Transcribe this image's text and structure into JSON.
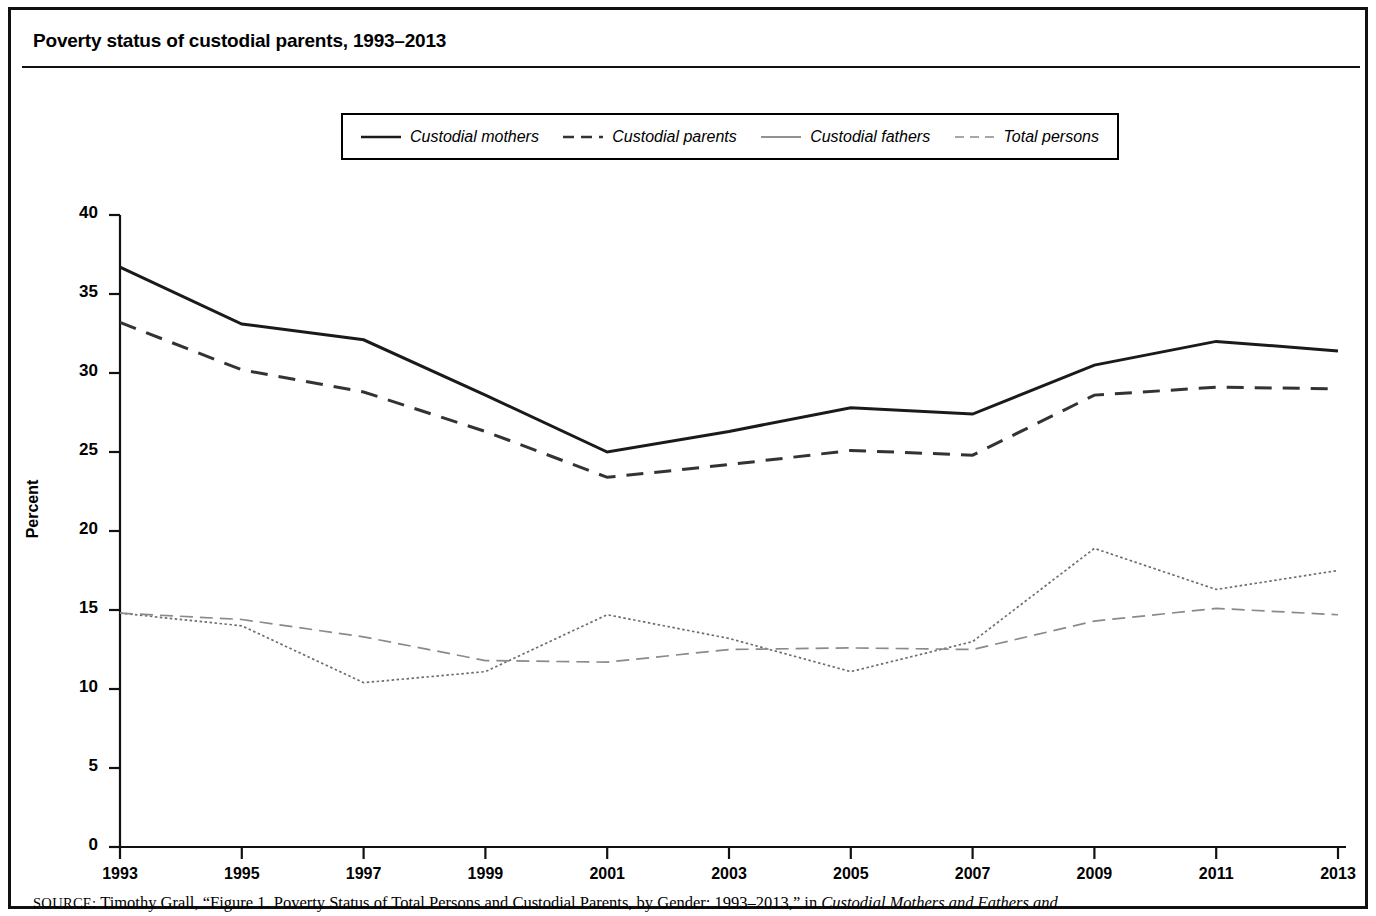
{
  "figure": {
    "title": "Poverty status of custodial parents, 1993–2013",
    "source_kicker": "SOURCE:",
    "source_text_1": " Timothy Grall, “Figure 1. Poverty Status of Total Persons and Custodial Parents, by Gender: 1993–2013,” in ",
    "source_text_italic": "Custodial Mothers and Fathers and"
  },
  "legend": {
    "position": "top-center",
    "items": [
      {
        "label": "Custodial mothers",
        "style": "solid",
        "swatch": "line-solid-icon",
        "color": "#1a1a1a"
      },
      {
        "label": "Custodial parents",
        "style": "dashed",
        "swatch": "line-dashed-icon",
        "color": "#333333"
      },
      {
        "label": "Custodial fathers",
        "style": "dotted",
        "swatch": "line-dotted-icon",
        "color": "#6e6e6e"
      },
      {
        "label": "Total persons",
        "style": "dashdot",
        "swatch": "line-dashdot-icon",
        "color": "#8a8a8a"
      }
    ]
  },
  "chart_data": {
    "type": "line",
    "title": "Poverty status of custodial parents, 1993–2013",
    "xlabel": "",
    "ylabel": "Percent",
    "x": [
      1993,
      1995,
      1997,
      1999,
      2001,
      2003,
      2005,
      2007,
      2009,
      2011,
      2013
    ],
    "categories": [
      "1993",
      "1995",
      "1997",
      "1999",
      "2001",
      "2003",
      "2005",
      "2007",
      "2009",
      "2011",
      "2013"
    ],
    "xlim": [
      1993,
      2013
    ],
    "ylim": [
      0,
      40
    ],
    "yticks": [
      0,
      5,
      10,
      15,
      20,
      25,
      30,
      35,
      40
    ],
    "ytick_labels": [
      "0",
      "5",
      "10",
      "15",
      "20",
      "25",
      "30",
      "35",
      "40"
    ],
    "grid": false,
    "series": [
      {
        "name": "Custodial mothers",
        "style": "solid",
        "color": "#1a1a1a",
        "values": [
          36.7,
          33.1,
          32.1,
          28.6,
          25.0,
          26.3,
          27.8,
          27.4,
          30.5,
          32.0,
          31.4
        ]
      },
      {
        "name": "Custodial parents",
        "style": "dashed",
        "color": "#333333",
        "values": [
          33.2,
          30.2,
          28.8,
          26.3,
          23.4,
          24.2,
          25.1,
          24.8,
          28.6,
          29.1,
          29.0
        ]
      },
      {
        "name": "Custodial fathers",
        "style": "dotted",
        "color": "#6e6e6e",
        "values": [
          14.8,
          14.0,
          10.4,
          11.1,
          14.7,
          13.2,
          11.1,
          13.0,
          18.9,
          16.3,
          17.5
        ]
      },
      {
        "name": "Total persons",
        "style": "dashdot",
        "color": "#8a8a8a",
        "values": [
          14.8,
          14.4,
          13.3,
          11.8,
          11.7,
          12.5,
          12.6,
          12.5,
          14.3,
          15.1,
          14.7
        ]
      }
    ]
  }
}
